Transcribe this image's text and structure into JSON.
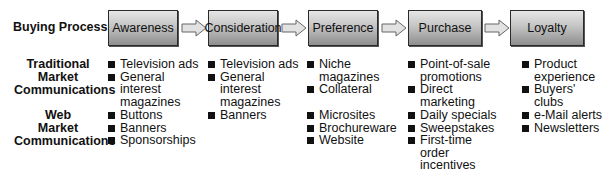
{
  "header_label": "Buying Process",
  "stages": [
    "Awareness",
    "Consideration",
    "Preference",
    "Purchase",
    "Loyalty"
  ],
  "rows": [
    {
      "label_lines": [
        "Traditional",
        "Market",
        "Communications"
      ],
      "columns": [
        [
          "Television ads",
          "General interest magazines"
        ],
        [
          "Television ads",
          "General interest magazines"
        ],
        [
          "Niche magazines",
          "Collateral"
        ],
        [
          "Point-of-sale promotions",
          "Direct marketing"
        ],
        [
          "Product experience",
          "Buyers' clubs"
        ]
      ]
    },
    {
      "label_lines": [
        "Web",
        "Market",
        "Communications"
      ],
      "columns": [
        [
          "Buttons",
          "Banners",
          "Sponsorships"
        ],
        [
          "Banners"
        ],
        [
          "Microsites",
          "Brochureware",
          "Website"
        ],
        [
          "Daily specials",
          "Sweepstakes",
          "First-time order incentives"
        ],
        [
          "e-Mail alerts",
          "Newsletters"
        ]
      ]
    }
  ],
  "colors": {
    "box_top": "#e6e6e6",
    "box_bottom": "#8e8e8e",
    "border": "#2a2a2a",
    "arrow_fill": "#e2e2e2"
  }
}
